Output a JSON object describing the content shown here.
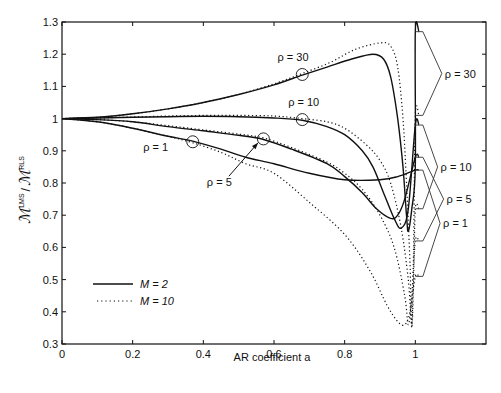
{
  "chart_data": {
    "type": "line",
    "title": "",
    "xlabel": "AR coefficient a",
    "ylabel": "M_min^LMS / M_min^RLS",
    "ylabel_parts": {
      "main1": "ℳ",
      "sup1": "LMS",
      "sub1": "min",
      "sep": "/",
      "main2": "ℳ",
      "sup2": "RLS",
      "sub2": "min"
    },
    "xlim": [
      0,
      1.2
    ],
    "ylim": [
      0.3,
      1.3
    ],
    "xticks": [
      0,
      0.2,
      0.4,
      0.6,
      0.8,
      1
    ],
    "xtick_labels": [
      "0",
      "0.2",
      "0.4",
      "0.6",
      "0.8",
      "1"
    ],
    "yticks": [
      0.3,
      0.4,
      0.5,
      0.6,
      0.7,
      0.8,
      0.9,
      1,
      1.1,
      1.2,
      1.3
    ],
    "ytick_labels": [
      "0.3",
      "0.4",
      "0.5",
      "0.6",
      "0.7",
      "0.8",
      "0.9",
      "1",
      "1.1",
      "1.2",
      "1.3"
    ],
    "grid": false,
    "legend": {
      "position": "lower left",
      "entries": [
        {
          "label": "M = 2",
          "style": "solid"
        },
        {
          "label": "M = 10",
          "style": "dotted"
        }
      ]
    },
    "series": [
      {
        "name": "rho=30, M=2",
        "style": "solid",
        "points": [
          [
            0,
            1
          ],
          [
            0.1,
            1.004
          ],
          [
            0.2,
            1.015
          ],
          [
            0.3,
            1.03
          ],
          [
            0.4,
            1.05
          ],
          [
            0.5,
            1.075
          ],
          [
            0.6,
            1.105
          ],
          [
            0.68,
            1.135
          ],
          [
            0.75,
            1.16
          ],
          [
            0.82,
            1.185
          ],
          [
            0.88,
            1.2
          ],
          [
            0.91,
            1.185
          ],
          [
            0.93,
            1.13
          ],
          [
            0.95,
            1.0
          ],
          [
            0.965,
            0.85
          ],
          [
            0.975,
            0.7
          ],
          [
            0.98,
            0.65
          ],
          [
            0.99,
            0.72
          ],
          [
            1.0,
            0.85
          ],
          [
            1.0,
            1.27
          ],
          [
            1.01,
            1.27
          ]
        ]
      },
      {
        "name": "rho=30, M=10",
        "style": "dotted",
        "points": [
          [
            0,
            1
          ],
          [
            0.1,
            1.004
          ],
          [
            0.2,
            1.015
          ],
          [
            0.3,
            1.03
          ],
          [
            0.4,
            1.05
          ],
          [
            0.5,
            1.075
          ],
          [
            0.6,
            1.108
          ],
          [
            0.68,
            1.14
          ],
          [
            0.76,
            1.175
          ],
          [
            0.83,
            1.215
          ],
          [
            0.9,
            1.235
          ],
          [
            0.93,
            1.225
          ],
          [
            0.95,
            1.16
          ],
          [
            0.965,
            1.0
          ],
          [
            0.975,
            0.8
          ],
          [
            0.985,
            0.55
          ],
          [
            0.99,
            0.35
          ],
          [
            0.995,
            0.6
          ],
          [
            1.0,
            1.01
          ],
          [
            1.01,
            1.01
          ]
        ]
      },
      {
        "name": "rho=10, M=2",
        "style": "solid",
        "points": [
          [
            0,
            1
          ],
          [
            0.1,
            1.002
          ],
          [
            0.2,
            1.004
          ],
          [
            0.3,
            1.006
          ],
          [
            0.4,
            1.007
          ],
          [
            0.5,
            1.006
          ],
          [
            0.6,
            1.002
          ],
          [
            0.68,
            0.995
          ],
          [
            0.75,
            0.975
          ],
          [
            0.8,
            0.95
          ],
          [
            0.85,
            0.9
          ],
          [
            0.88,
            0.85
          ],
          [
            0.91,
            0.77
          ],
          [
            0.94,
            0.69
          ],
          [
            0.96,
            0.66
          ],
          [
            0.98,
            0.72
          ],
          [
            1.0,
            0.98
          ],
          [
            1.01,
            0.98
          ]
        ]
      },
      {
        "name": "rho=10, M=10",
        "style": "dotted",
        "points": [
          [
            0,
            1
          ],
          [
            0.1,
            1.002
          ],
          [
            0.2,
            1.005
          ],
          [
            0.3,
            1.008
          ],
          [
            0.4,
            1.01
          ],
          [
            0.5,
            1.01
          ],
          [
            0.6,
            1.008
          ],
          [
            0.68,
            1.0
          ],
          [
            0.75,
            0.99
          ],
          [
            0.8,
            0.97
          ],
          [
            0.86,
            0.92
          ],
          [
            0.9,
            0.87
          ],
          [
            0.93,
            0.8
          ],
          [
            0.96,
            0.66
          ],
          [
            0.98,
            0.5
          ],
          [
            0.99,
            0.36
          ],
          [
            0.995,
            0.5
          ],
          [
            1.0,
            0.72
          ],
          [
            1.01,
            0.72
          ]
        ]
      },
      {
        "name": "rho=5, M=2",
        "style": "solid",
        "points": [
          [
            0,
            1
          ],
          [
            0.1,
            0.997
          ],
          [
            0.2,
            0.99
          ],
          [
            0.3,
            0.975
          ],
          [
            0.4,
            0.962
          ],
          [
            0.5,
            0.948
          ],
          [
            0.57,
            0.935
          ],
          [
            0.65,
            0.905
          ],
          [
            0.75,
            0.86
          ],
          [
            0.8,
            0.82
          ],
          [
            0.85,
            0.77
          ],
          [
            0.89,
            0.72
          ],
          [
            0.93,
            0.69
          ],
          [
            0.95,
            0.7
          ],
          [
            0.97,
            0.75
          ],
          [
            1.0,
            0.88
          ],
          [
            1.01,
            0.88
          ]
        ]
      },
      {
        "name": "rho=5, M=10",
        "style": "dotted",
        "points": [
          [
            0,
            1
          ],
          [
            0.1,
            0.997
          ],
          [
            0.2,
            0.99
          ],
          [
            0.3,
            0.978
          ],
          [
            0.4,
            0.965
          ],
          [
            0.5,
            0.952
          ],
          [
            0.57,
            0.94
          ],
          [
            0.65,
            0.91
          ],
          [
            0.75,
            0.865
          ],
          [
            0.8,
            0.83
          ],
          [
            0.85,
            0.78
          ],
          [
            0.9,
            0.7
          ],
          [
            0.94,
            0.6
          ],
          [
            0.97,
            0.45
          ],
          [
            0.98,
            0.36
          ],
          [
            0.99,
            0.45
          ],
          [
            1.0,
            0.62
          ],
          [
            1.01,
            0.62
          ]
        ]
      },
      {
        "name": "rho=1, M=2",
        "style": "solid",
        "points": [
          [
            0,
            1
          ],
          [
            0.1,
            0.99
          ],
          [
            0.2,
            0.97
          ],
          [
            0.3,
            0.945
          ],
          [
            0.37,
            0.93
          ],
          [
            0.45,
            0.905
          ],
          [
            0.52,
            0.88
          ],
          [
            0.6,
            0.86
          ],
          [
            0.7,
            0.83
          ],
          [
            0.8,
            0.81
          ],
          [
            0.9,
            0.81
          ],
          [
            0.95,
            0.82
          ],
          [
            1.0,
            0.84
          ],
          [
            1.01,
            0.84
          ]
        ]
      },
      {
        "name": "rho=1, M=10",
        "style": "dotted",
        "points": [
          [
            0,
            1
          ],
          [
            0.1,
            0.99
          ],
          [
            0.2,
            0.97
          ],
          [
            0.3,
            0.945
          ],
          [
            0.37,
            0.925
          ],
          [
            0.45,
            0.895
          ],
          [
            0.52,
            0.86
          ],
          [
            0.6,
            0.83
          ],
          [
            0.7,
            0.74
          ],
          [
            0.8,
            0.64
          ],
          [
            0.87,
            0.53
          ],
          [
            0.92,
            0.42
          ],
          [
            0.95,
            0.37
          ],
          [
            0.97,
            0.36
          ],
          [
            0.985,
            0.4
          ],
          [
            1.0,
            0.51
          ],
          [
            1.01,
            0.51
          ]
        ]
      }
    ],
    "markers": [
      {
        "series": "rho=30",
        "a": 0.68,
        "value": 1.137
      },
      {
        "series": "rho=10",
        "a": 0.68,
        "value": 0.997
      },
      {
        "series": "rho=5",
        "a": 0.57,
        "value": 0.937
      },
      {
        "series": "rho=1",
        "a": 0.37,
        "value": 0.928
      }
    ],
    "annotations": [
      {
        "text": "ρ = 30",
        "a": 0.61,
        "value": 1.18
      },
      {
        "text": "ρ = 10",
        "a": 0.64,
        "value": 1.04
      },
      {
        "text": "ρ = 1",
        "a": 0.23,
        "value": 0.9
      },
      {
        "text": "ρ = 5",
        "a": 0.41,
        "value": 0.79,
        "arrow_to": [
          0.555,
          0.925
        ]
      }
    ],
    "brackets": [
      {
        "label": "ρ = 30",
        "top": 1.27,
        "bottom": 1.01,
        "apex_a": 1.075
      },
      {
        "label": "ρ = 10",
        "top": 0.98,
        "bottom": 0.72,
        "apex_a": 1.063
      },
      {
        "label": "ρ = 5",
        "top": 0.88,
        "bottom": 0.62,
        "apex_a": 1.08
      },
      {
        "label": "ρ = 1",
        "top": 0.84,
        "bottom": 0.51,
        "apex_a": 1.07
      }
    ]
  }
}
